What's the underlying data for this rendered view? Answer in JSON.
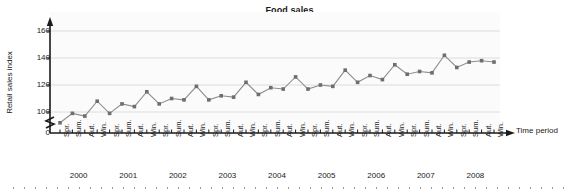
{
  "chart_data": {
    "type": "line",
    "title": "Food sales",
    "xlabel": "Time period",
    "ylabel": "Retail sales index",
    "ylim": [
      0,
      170
    ],
    "yticks": [
      0,
      100,
      120,
      140,
      160
    ],
    "ytick_labels": [
      "0",
      "100",
      "120",
      "140",
      "160"
    ],
    "axis_break": true,
    "grid": true,
    "grid_axis": "y",
    "legend": "none",
    "marker": "square",
    "line_color": "#8c8c8c",
    "marker_color": "#6e6e6e",
    "grid_color": "#dcdcdc",
    "axis_color": "#1a1a1a",
    "plot_bg": "#fbfbfb",
    "seasons": [
      "Spr.",
      "Sum.",
      "Aut.",
      "Win."
    ],
    "years": [
      "2000",
      "2001",
      "2002",
      "2003",
      "2004",
      "2005",
      "2006",
      "2007",
      "2008"
    ],
    "categories": [
      "Spr. 2000",
      "Sum. 2000",
      "Aut. 2000",
      "Win. 2000",
      "Spr. 2001",
      "Sum. 2001",
      "Aut. 2001",
      "Win. 2001",
      "Spr. 2002",
      "Sum. 2002",
      "Aut. 2002",
      "Win. 2002",
      "Spr. 2003",
      "Sum. 2003",
      "Aut. 2003",
      "Win. 2003",
      "Spr. 2004",
      "Sum. 2004",
      "Aut. 2004",
      "Win. 2004",
      "Spr. 2005",
      "Sum. 2005",
      "Aut. 2005",
      "Win. 2005",
      "Spr. 2006",
      "Sum. 2006",
      "Aut. 2006",
      "Win. 2006",
      "Spr. 2007",
      "Sum. 2007",
      "Aut. 2007",
      "Win. 2007",
      "Spr. 2008",
      "Sum. 2008",
      "Aut. 2008",
      "Win. 2008"
    ],
    "values": [
      92,
      99,
      97,
      108,
      99,
      106,
      104,
      115,
      106,
      110,
      109,
      119,
      109,
      112,
      111,
      122,
      113,
      118,
      117,
      126,
      117,
      120,
      119,
      131,
      122,
      127,
      124,
      135,
      128,
      130,
      129,
      142,
      133,
      137,
      138,
      137
    ]
  }
}
